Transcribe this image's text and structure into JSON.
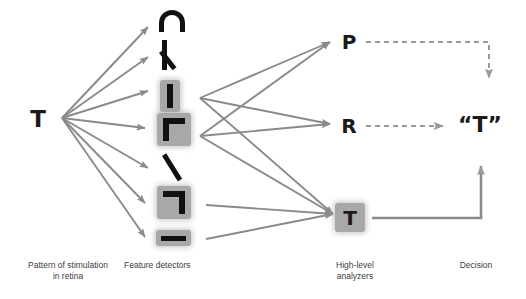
{
  "diagram": {
    "colors": {
      "ink": "#111111",
      "arrow": "#808080",
      "highlight_plate": "#a8a8a8",
      "caption_text": "#3d3d3d",
      "background": "#ffffff"
    }
  },
  "stages": {
    "input": {
      "caption": "Pattern of stimulation\nin retina",
      "symbol": "T"
    },
    "detectors": {
      "caption": "Feature detectors",
      "items": [
        {
          "id": "arc",
          "icon": "arc-opening-down-glyph",
          "label": "⊃",
          "highlighted": false
        },
        {
          "id": "angle",
          "icon": "angled-lambda-glyph",
          "label": "ʌ",
          "highlighted": false
        },
        {
          "id": "vertical-bar",
          "icon": "vertical-bar-glyph",
          "label": "|",
          "highlighted": true
        },
        {
          "id": "corner-upleft",
          "icon": "corner-upper-left-glyph",
          "label": "Γ",
          "highlighted": true
        },
        {
          "id": "diagonal",
          "icon": "diagonal-stroke-glyph",
          "label": "\\",
          "highlighted": false
        },
        {
          "id": "corner-upright",
          "icon": "corner-upper-right-glyph",
          "label": "┐",
          "highlighted": true
        },
        {
          "id": "horizontal-bar",
          "icon": "horizontal-bar-glyph",
          "label": "—",
          "highlighted": true
        }
      ]
    },
    "analyzers": {
      "caption": "High-level\nanalyzers",
      "items": [
        {
          "id": "P",
          "label": "P",
          "highlighted": false
        },
        {
          "id": "R",
          "label": "R",
          "highlighted": false
        },
        {
          "id": "T",
          "label": "T",
          "highlighted": true
        }
      ]
    },
    "decision": {
      "caption": "Decision",
      "label": "“T”"
    }
  }
}
